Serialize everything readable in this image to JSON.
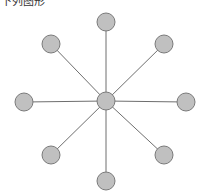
{
  "header": {
    "cutoff_text": "下列图形"
  },
  "diagram": {
    "type": "star-graph",
    "center": {
      "x": 106,
      "y": 101,
      "r": 9
    },
    "node_radius": 9,
    "node_fill": "#c0c0c0",
    "node_stroke": "#7a7a7a",
    "edge_color": "#6e6e6e",
    "nodes": [
      {
        "id": "top",
        "x": 106,
        "y": 22
      },
      {
        "id": "top-right",
        "x": 164,
        "y": 44
      },
      {
        "id": "right",
        "x": 186,
        "y": 102
      },
      {
        "id": "bottom-right",
        "x": 164,
        "y": 155
      },
      {
        "id": "bottom",
        "x": 106,
        "y": 181
      },
      {
        "id": "bottom-left",
        "x": 51,
        "y": 155
      },
      {
        "id": "left",
        "x": 24,
        "y": 102
      },
      {
        "id": "top-left",
        "x": 51,
        "y": 44
      }
    ]
  }
}
